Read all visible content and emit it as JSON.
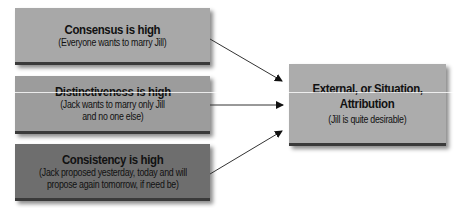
{
  "causes": [
    {
      "title": "Consensus is high",
      "lines": [
        "(Everyone wants to marry Jill)"
      ],
      "fill": "#a8a8a8"
    },
    {
      "title": "Distinctiveness is high",
      "lines": [
        "(Jack wants to marry only Jill",
        "and no one else)"
      ],
      "fill": "#9c9c9c"
    },
    {
      "title": "Consistency is high",
      "lines": [
        "(Jack proposed yesterday, today and will",
        "propose again tomorrow, if need be)"
      ],
      "fill": "#6e6e6e"
    }
  ],
  "result": {
    "title_lines": [
      "External, or Situation,",
      "Attribution"
    ],
    "sub": "(Jill is quite desirable)",
    "fill": "#acacac"
  },
  "edges": [
    {
      "from": "causes.0",
      "to": "result"
    },
    {
      "from": "causes.1",
      "to": "result"
    },
    {
      "from": "causes.2",
      "to": "result"
    }
  ]
}
